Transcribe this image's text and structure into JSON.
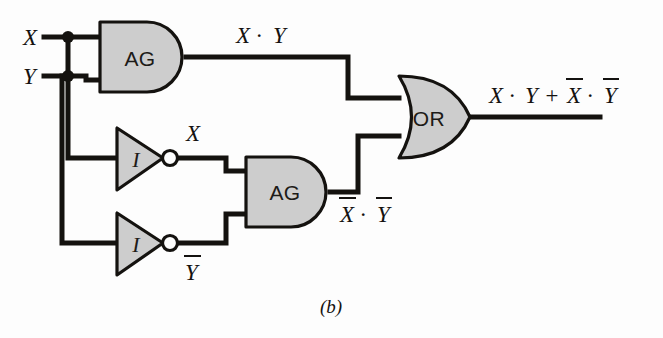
{
  "figure": {
    "caption": "(b)",
    "colors": {
      "background": "#fdfdfd",
      "gate_fill": "#cdcdcd",
      "wire": "#14120f",
      "outline": "#14120f"
    }
  },
  "inputs": [
    {
      "id": "x",
      "label": "X"
    },
    {
      "id": "y",
      "label": "Y"
    }
  ],
  "gates": [
    {
      "id": "and1",
      "type": "and",
      "label": "AG"
    },
    {
      "id": "and2",
      "type": "and",
      "label": "AG"
    },
    {
      "id": "inv1",
      "type": "inverter",
      "label": "I"
    },
    {
      "id": "inv2",
      "type": "inverter",
      "label": "I"
    },
    {
      "id": "or1",
      "type": "or",
      "label": "OR"
    }
  ],
  "signals": {
    "and1_out": {
      "text": "X · Y",
      "parts": [
        "X",
        "·",
        "Y"
      ]
    },
    "inv1_out": {
      "text": "X",
      "overbar": false
    },
    "inv2_out": {
      "text": "Y",
      "overbar": true
    },
    "and2_out": {
      "text": "X · Y",
      "left_overbar": true,
      "right_overbar": true
    },
    "or_out": {
      "text": "X · Y + X · Y",
      "first_term_overbar": false,
      "second_term_overbar": true
    }
  }
}
